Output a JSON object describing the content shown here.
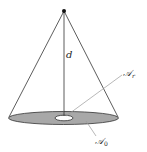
{
  "diagram": {
    "labels": {
      "distance": "d",
      "inner_area": "𝒜",
      "inner_area_sub": "r",
      "outer_area": "𝒜",
      "outer_area_sub": "0"
    },
    "colors": {
      "disk_fill": "#a8a8a8",
      "line": "#333333",
      "hole_fill": "#ffffff",
      "leader_line": "#9a9a9a"
    }
  }
}
